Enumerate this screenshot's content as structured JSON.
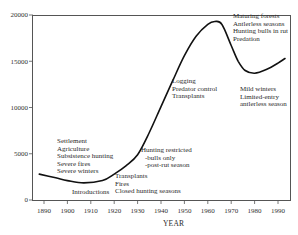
{
  "chart_data": {
    "type": "line",
    "title": "",
    "xlabel": "YEAR",
    "ylabel": "",
    "xlim": [
      1885,
      1995
    ],
    "ylim": [
      0,
      20000
    ],
    "grid": false,
    "legend": null,
    "x_ticks": [
      1890,
      1900,
      1910,
      1920,
      1930,
      1940,
      1950,
      1960,
      1970,
      1980,
      1990
    ],
    "y_ticks": [
      0,
      5000,
      10000,
      15000,
      20000
    ],
    "series": [
      {
        "name": "Population",
        "x": [
          1888,
          1895,
          1900,
          1907,
          1915,
          1920,
          1925,
          1930,
          1935,
          1940,
          1945,
          1950,
          1955,
          1960,
          1963,
          1966,
          1970,
          1973,
          1976,
          1980,
          1985,
          1990,
          1993
        ],
        "values": [
          2800,
          2400,
          2100,
          1850,
          2100,
          2800,
          3700,
          4900,
          7300,
          10100,
          12900,
          15600,
          17700,
          19000,
          19300,
          19000,
          16700,
          15000,
          14000,
          13700,
          14100,
          14800,
          15300
        ]
      }
    ],
    "annotations": [
      {
        "lines": [
          "Settlement",
          "Agriculture",
          "Subsistence hunting",
          "Severe fires",
          "Severe winters"
        ],
        "approx_year": 1900
      },
      {
        "lines": [
          "Introductions"
        ],
        "approx_year": 1910
      },
      {
        "lines": [
          "Transplants",
          "Fires",
          "Closed hunting seasons"
        ],
        "approx_year": 1920
      },
      {
        "lines": [
          "Hunting restricted",
          "-bulls only",
          "-post-rut season"
        ],
        "approx_year": 1930
      },
      {
        "lines": [
          "Logging",
          "Predator control",
          "Transplants"
        ],
        "approx_year": 1945
      },
      {
        "lines": [
          "Maturing forests",
          "Antlerless seasons",
          "Hunting bulls in rut",
          "Predation"
        ],
        "approx_year": 1970
      },
      {
        "lines": [
          "Mild winters",
          "Limited-entry",
          "antlerless season"
        ],
        "approx_year": 1980
      }
    ]
  },
  "labels": {
    "xlabel": "YEAR",
    "ann_settlement": [
      "Settlement",
      "Agriculture",
      "Subsistence hunting",
      "Severe fires",
      "Severe winters"
    ],
    "ann_introductions": "Introductions",
    "ann_transplants": [
      "Transplants",
      "Fires",
      "Closed hunting seasons"
    ],
    "ann_hunting": [
      "Hunting restricted",
      "-bulls only",
      "-post-rut season"
    ],
    "ann_logging": [
      "Logging",
      "Predator control",
      "Transplants"
    ],
    "ann_maturing": [
      "Maturing forests",
      "Antlerless seasons",
      "Hunting bulls in rut",
      "Predation"
    ],
    "ann_mild": [
      "Mild winters",
      "Limited-entry",
      "antlerless season"
    ]
  },
  "colors": {
    "line": "#111111",
    "axis": "#555555",
    "text": "#2a2a2a"
  }
}
